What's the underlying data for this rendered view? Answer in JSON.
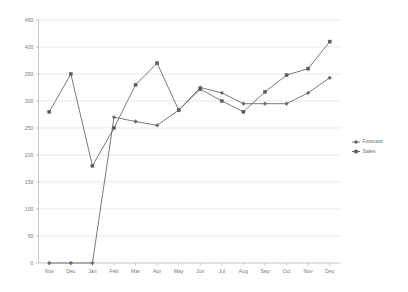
{
  "chart_data": {
    "type": "line",
    "title": "",
    "xlabel": "",
    "ylabel": "",
    "categories": [
      "Nov",
      "Dec",
      "Jan",
      "Feb",
      "Mar",
      "Apr",
      "May",
      "Jun",
      "Jul",
      "Aug",
      "Sep",
      "Oct",
      "Nov",
      "Dec"
    ],
    "ylim": [
      0,
      450
    ],
    "yticks": [
      0,
      50,
      100,
      150,
      200,
      250,
      300,
      350,
      400,
      450
    ],
    "ytick_labels": [
      "0",
      "50",
      "100",
      "150",
      "200",
      "250",
      "300",
      "350",
      "400",
      "450"
    ],
    "grid": true,
    "legend_position": "right",
    "series": [
      {
        "name": "Forecast",
        "marker": "diamond",
        "color": "#6b6b6b",
        "values": [
          0,
          0,
          0,
          270,
          262,
          255,
          283,
          325,
          315,
          295,
          295,
          295,
          315,
          343
        ]
      },
      {
        "name": "Sales",
        "marker": "square",
        "color": "#5a5a5a",
        "values": [
          280,
          350,
          180,
          250,
          330,
          370,
          283,
          322,
          300,
          280,
          317,
          348,
          360,
          410
        ]
      }
    ]
  },
  "legend": {
    "items": [
      {
        "label": "Forecast",
        "marker": "diamond"
      },
      {
        "label": "Sales",
        "marker": "square"
      }
    ]
  }
}
